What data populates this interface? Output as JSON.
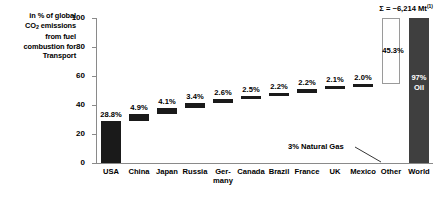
{
  "side_caption": {
    "line1": "in % of global",
    "line2_pre": "CO",
    "line2_sub": "2",
    "line2_post": " emissions",
    "line3": "from fuel",
    "line4": "combustion for",
    "line5": "Transport"
  },
  "sum_note": {
    "text": "Σ = ~6,214 Mt",
    "footnote": "(1)"
  },
  "annotations": {
    "natural_gas": "3% Natural Gas",
    "world_oil_line1": "97%",
    "world_oil_line2": "Oil"
  },
  "chart_data": {
    "type": "bar",
    "subtype": "waterfall",
    "title": "",
    "xlabel": "",
    "ylabel": "in % of global CO2 emissions from fuel combustion for Transport",
    "ylim": [
      0,
      100
    ],
    "yticks": [
      0,
      20,
      40,
      60,
      80,
      100
    ],
    "ytick_labels": [
      "0",
      "20",
      "40",
      "60",
      "80",
      "100"
    ],
    "grid": false,
    "legend": "none",
    "categories": [
      "USA",
      "China",
      "Japan",
      "Russia",
      "Ger-\nmany",
      "Canada",
      "Brazil",
      "France",
      "UK",
      "Mexico",
      "Other",
      "World"
    ],
    "values": [
      28.8,
      4.9,
      4.1,
      3.4,
      2.6,
      2.5,
      2.2,
      2.2,
      2.1,
      2.0,
      45.3,
      100.0
    ],
    "data_labels": [
      "28.8%",
      "4.9%",
      "4.1%",
      "3.4%",
      "2.6%",
      "2.5%",
      "2.2%",
      "2.2%",
      "2.1%",
      "2.0%",
      "45.3%",
      ""
    ],
    "cumulative_base": [
      0,
      28.8,
      33.7,
      37.8,
      41.2,
      43.8,
      46.3,
      48.5,
      50.7,
      52.8,
      54.8,
      0
    ],
    "cumulative_top": [
      28.8,
      33.7,
      37.8,
      41.2,
      43.8,
      46.3,
      48.5,
      50.7,
      52.8,
      54.8,
      100.0,
      100.0
    ],
    "styles": [
      "solid",
      "solid",
      "solid",
      "solid",
      "solid",
      "solid",
      "solid",
      "solid",
      "solid",
      "solid",
      "open",
      "total"
    ],
    "colors": {
      "bar_fill": "#1a1a1a",
      "open_box_border": "#9a9a9a",
      "open_box_fill": "#ffffff",
      "total_bar_fill": "#3f3f3f",
      "axis": "#8a8a8a",
      "text": "#000000",
      "inside_label": "#ffffff"
    }
  }
}
